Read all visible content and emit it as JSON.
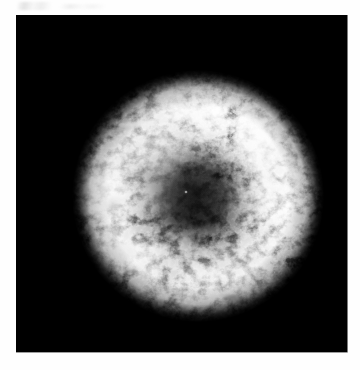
{
  "page": {
    "background_color": "#ffffff",
    "width": 360,
    "height": 370
  },
  "figure": {
    "name": "supernova-remnant-image",
    "kind": "astronomical-image",
    "caption": "",
    "alt_text": "Grayscale astronomical image of a shell-type supernova remnant",
    "panel": {
      "x": 16,
      "y": 15,
      "width": 332,
      "height": 338,
      "background_color": "#000000",
      "border": "none"
    },
    "colormap": {
      "type": "grayscale",
      "low_color": "#000000",
      "high_color": "#ffffff"
    },
    "structure": {
      "shape": "roughly circular shell",
      "center_x": 182,
      "center_y": 181,
      "radius": 118,
      "central_cavity": "dark, low surface brightness",
      "brightest_region": "northern / upper-right ridge",
      "secondary_bright_region": "western clumpy emission",
      "faint_region": "southern rim",
      "detached_knot": "faint isolated clump below the southern rim"
    },
    "annotations": [],
    "axes": {
      "visible": false,
      "tick_labels": [],
      "axis_labels": []
    },
    "colorbar": {
      "visible": false
    }
  }
}
